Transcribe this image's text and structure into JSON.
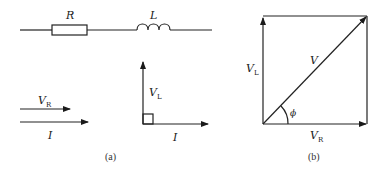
{
  "figure": {
    "panel_a": {
      "caption": "(a)",
      "circuit": {
        "resistor_label": "R",
        "inductor_label": "L"
      },
      "resistor_phasors": {
        "voltage_label": "V",
        "voltage_sub": "R",
        "current_label": "I"
      },
      "inductor_phasors": {
        "voltage_label": "V",
        "voltage_sub": "L",
        "current_label": "I"
      }
    },
    "panel_b": {
      "caption": "(b)",
      "vl_label": "V",
      "vl_sub": "L",
      "v_label": "V",
      "vr_label": "V",
      "vr_sub": "R",
      "angle_label": "ϕ"
    }
  }
}
